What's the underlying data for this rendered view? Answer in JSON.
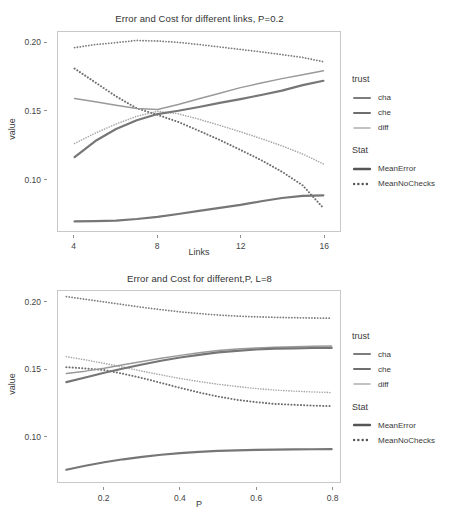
{
  "chart_data": [
    {
      "type": "line",
      "title": "Error and Cost for different links, P=0.2",
      "xlabel": "Links",
      "ylabel": "value",
      "xlim": [
        3.2,
        16.8
      ],
      "ylim": [
        0.062,
        0.208
      ],
      "xticks": [
        "4",
        "8",
        "12",
        "16"
      ],
      "xtickvals": [
        4,
        8,
        12,
        16
      ],
      "yticks": [
        "0.20",
        "0.15",
        "0.10"
      ],
      "ytickvals": [
        0.2,
        0.15,
        0.1
      ],
      "grid": false,
      "legend_position": "right",
      "x": [
        4,
        5,
        6,
        7,
        8,
        9,
        10,
        11,
        12,
        13,
        14,
        15,
        16
      ],
      "series": [
        {
          "name": "MeanNoChecks-cha",
          "trust": "cha",
          "stat": "MeanNoChecks",
          "dash": "dotted",
          "color": "#7d7d7d",
          "width": 1.8,
          "values": [
            0.1965,
            0.1988,
            0.2002,
            0.2018,
            0.2014,
            0.2004,
            0.1988,
            0.197,
            0.1952,
            0.1934,
            0.1914,
            0.1893,
            0.1862
          ]
        },
        {
          "name": "MeanNoChecks-che",
          "trust": "che",
          "stat": "MeanNoChecks",
          "dash": "dotted",
          "color": "#6e6e6e",
          "width": 2.0,
          "values": [
            0.1812,
            0.171,
            0.1608,
            0.152,
            0.1472,
            0.142,
            0.1355,
            0.1288,
            0.1215,
            0.114,
            0.1055,
            0.0955,
            0.0788
          ]
        },
        {
          "name": "MeanNoChecks-diff",
          "trust": "diff",
          "stat": "MeanNoChecks",
          "dash": "dotted",
          "color": "#a8a8a8",
          "width": 1.6,
          "values": [
            0.1262,
            0.1338,
            0.1405,
            0.1462,
            0.1498,
            0.148,
            0.144,
            0.1395,
            0.1348,
            0.1298,
            0.1245,
            0.1185,
            0.1112
          ]
        },
        {
          "name": "MeanError-diff",
          "trust": "diff",
          "stat": "MeanError",
          "dash": "solid",
          "color": "#9a9a9a",
          "width": 1.5,
          "values": [
            0.1592,
            0.1568,
            0.1542,
            0.1518,
            0.1512,
            0.1548,
            0.159,
            0.163,
            0.1672,
            0.1706,
            0.1738,
            0.1766,
            0.1795
          ]
        },
        {
          "name": "MeanError-cha",
          "trust": "cha",
          "stat": "MeanError",
          "dash": "solid",
          "color": "#767676",
          "width": 2.2,
          "values": [
            0.1162,
            0.128,
            0.1368,
            0.1432,
            0.1478,
            0.1502,
            0.153,
            0.156,
            0.1588,
            0.1618,
            0.165,
            0.169,
            0.1722
          ]
        },
        {
          "name": "MeanError-che",
          "trust": "che",
          "stat": "MeanError",
          "dash": "solid",
          "color": "#767676",
          "width": 2.2,
          "values": [
            0.069,
            0.0692,
            0.0696,
            0.0708,
            0.0724,
            0.0745,
            0.0768,
            0.079,
            0.0812,
            0.0838,
            0.0862,
            0.0878,
            0.0882
          ]
        }
      ]
    },
    {
      "type": "line",
      "title": "Error and Cost for different,P, L=8",
      "xlabel": "P",
      "ylabel": "value",
      "xlim": [
        0.078,
        0.822
      ],
      "ylim": [
        0.066,
        0.209
      ],
      "xticks": [
        "0.2",
        "0.4",
        "0.6",
        "0.8"
      ],
      "xtickvals": [
        0.2,
        0.4,
        0.6,
        0.8
      ],
      "yticks": [
        "0.20",
        "0.15",
        "0.10"
      ],
      "ytickvals": [
        0.2,
        0.15,
        0.1
      ],
      "grid": false,
      "legend_position": "right",
      "x": [
        0.1,
        0.15,
        0.2,
        0.25,
        0.3,
        0.35,
        0.4,
        0.45,
        0.5,
        0.55,
        0.6,
        0.65,
        0.7,
        0.75,
        0.8
      ],
      "series": [
        {
          "name": "MeanNoChecks-cha",
          "trust": "cha",
          "stat": "MeanNoChecks",
          "dash": "dotted",
          "color": "#7d7d7d",
          "width": 1.8,
          "values": [
            0.2048,
            0.2028,
            0.2008,
            0.1988,
            0.1968,
            0.195,
            0.1934,
            0.1921,
            0.191,
            0.1902,
            0.1897,
            0.1893,
            0.189,
            0.1888,
            0.1886
          ]
        },
        {
          "name": "MeanNoChecks-che",
          "trust": "che",
          "stat": "MeanNoChecks",
          "dash": "dotted",
          "color": "#6e6e6e",
          "width": 2.0,
          "values": [
            0.152,
            0.151,
            0.1498,
            0.147,
            0.1438,
            0.1402,
            0.1365,
            0.133,
            0.13,
            0.1275,
            0.1258,
            0.1245,
            0.1238,
            0.1232,
            0.1228
          ]
        },
        {
          "name": "MeanNoChecks-diff",
          "trust": "diff",
          "stat": "MeanNoChecks",
          "dash": "dotted",
          "color": "#a8a8a8",
          "width": 1.6,
          "values": [
            0.1598,
            0.1575,
            0.1548,
            0.152,
            0.149,
            0.1462,
            0.1435,
            0.1412,
            0.1392,
            0.1375,
            0.136,
            0.1348,
            0.134,
            0.1334,
            0.133
          ]
        },
        {
          "name": "MeanError-diff",
          "trust": "diff",
          "stat": "MeanError",
          "dash": "solid",
          "color": "#9a9a9a",
          "width": 1.5,
          "values": [
            0.1472,
            0.149,
            0.1512,
            0.1538,
            0.1562,
            0.1586,
            0.1608,
            0.1628,
            0.1645,
            0.1656,
            0.1664,
            0.1669,
            0.1673,
            0.1676,
            0.1678
          ]
        },
        {
          "name": "MeanError-cha",
          "trust": "cha",
          "stat": "MeanError",
          "dash": "solid",
          "color": "#767676",
          "width": 2.2,
          "values": [
            0.1408,
            0.1442,
            0.1478,
            0.151,
            0.154,
            0.1568,
            0.1592,
            0.1612,
            0.163,
            0.1642,
            0.1652,
            0.1658,
            0.1661,
            0.1663,
            0.1664
          ]
        },
        {
          "name": "MeanError-che",
          "trust": "che",
          "stat": "MeanError",
          "dash": "solid",
          "color": "#767676",
          "width": 2.2,
          "values": [
            0.0752,
            0.0782,
            0.0808,
            0.083,
            0.0848,
            0.0864,
            0.0876,
            0.0886,
            0.0893,
            0.0897,
            0.09,
            0.0902,
            0.0904,
            0.0905,
            0.0906
          ]
        }
      ]
    }
  ],
  "figure1": {
    "title": "Error and Cost for different links, P=0.2",
    "ylabel": "value",
    "xlabel": "Links",
    "yticks": [
      "0.20",
      "0.15",
      "0.10"
    ],
    "xticks": [
      "4",
      "8",
      "12",
      "16"
    ],
    "legend": {
      "groups": [
        {
          "title": "trust",
          "items": [
            {
              "label": "cha",
              "dash": "solid",
              "color": "#7d7d7d",
              "width": 2.0
            },
            {
              "label": "che",
              "dash": "solid",
              "color": "#6e6e6e",
              "width": 2.0
            },
            {
              "label": "diff",
              "dash": "solid",
              "color": "#b0b0b0",
              "width": 1.6
            }
          ]
        },
        {
          "title": "Stat",
          "items": [
            {
              "label": "MeanError",
              "dash": "solid",
              "color": "#555555",
              "width": 2.4
            },
            {
              "label": "MeanNoChecks",
              "dash": "dotted",
              "color": "#555555",
              "width": 2.4
            }
          ]
        }
      ]
    }
  },
  "figure2": {
    "title": "Error and Cost for different,P, L=8",
    "ylabel": "value",
    "xlabel": "P",
    "yticks": [
      "0.20",
      "0.15",
      "0.10"
    ],
    "xticks": [
      "0.2",
      "0.4",
      "0.6",
      "0.8"
    ],
    "legend": {
      "groups": [
        {
          "title": "trust",
          "items": [
            {
              "label": "cha",
              "dash": "solid",
              "color": "#7d7d7d",
              "width": 2.0
            },
            {
              "label": "che",
              "dash": "solid",
              "color": "#6e6e6e",
              "width": 2.0
            },
            {
              "label": "diff",
              "dash": "solid",
              "color": "#b0b0b0",
              "width": 1.6
            }
          ]
        },
        {
          "title": "Stat",
          "items": [
            {
              "label": "MeanError",
              "dash": "solid",
              "color": "#555555",
              "width": 2.4
            },
            {
              "label": "MeanNoChecks",
              "dash": "dotted",
              "color": "#555555",
              "width": 2.4
            }
          ]
        }
      ]
    }
  }
}
